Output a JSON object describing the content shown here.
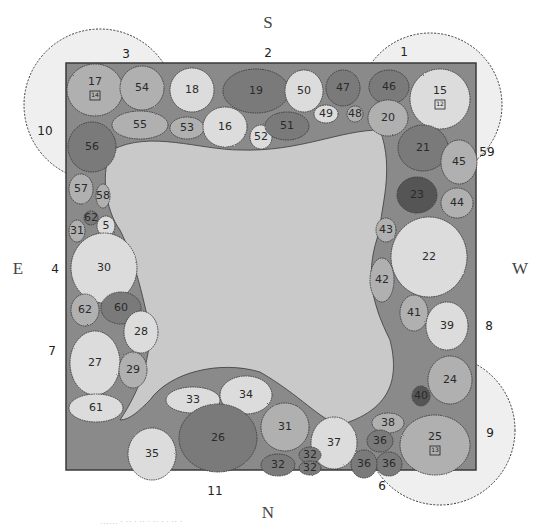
{
  "compass": {
    "north": "N",
    "south": "S",
    "east": "E",
    "west": "W"
  },
  "colors": {
    "border_fill": "#8a8a8a",
    "lawn_fill": "#c9c9c9",
    "tree_canopy": "#ececec",
    "outline": "#3a3a3a",
    "plant_light": "#dcdcdc",
    "plant_mid": "#b0b0b0",
    "plant_dark": "#7a7a7a",
    "plant_darkest": "#555555"
  },
  "bed": {
    "x": 66,
    "y": 63,
    "width": 410,
    "height": 407
  },
  "tree_rings": [
    {
      "label": "3",
      "cx": 100,
      "cy": 105,
      "r": 76,
      "label_x": 126,
      "label_y": 58
    },
    {
      "label": "10",
      "cx": 100,
      "cy": 105,
      "r": 76,
      "label_x": 45,
      "label_y": 135,
      "shared": true
    },
    {
      "label": "1",
      "cx": 430,
      "cy": 105,
      "r": 72,
      "label_x": 404,
      "label_y": 56
    },
    {
      "label": "59",
      "cx": 430,
      "cy": 105,
      "r": 72,
      "label_x": 487,
      "label_y": 156,
      "shared": true
    },
    {
      "label": "9",
      "cx": 440,
      "cy": 430,
      "r": 75,
      "label_x": 490,
      "label_y": 437
    },
    {
      "label": "6",
      "cx": 440,
      "cy": 430,
      "r": 75,
      "label_x": 382,
      "label_y": 490,
      "shared": true
    }
  ],
  "edge_labels": [
    {
      "label": "2",
      "x": 268,
      "y": 57
    },
    {
      "label": "4",
      "x": 55,
      "y": 273
    },
    {
      "label": "7",
      "x": 52,
      "y": 355
    },
    {
      "label": "8",
      "x": 489,
      "y": 330
    },
    {
      "label": "11",
      "x": 215,
      "y": 495
    }
  ],
  "plants": [
    {
      "id": "17",
      "cx": 95,
      "cy": 90,
      "rx": 28,
      "ry": 26,
      "tone": "mid",
      "badge": "14"
    },
    {
      "id": "54",
      "cx": 142,
      "cy": 88,
      "rx": 22,
      "ry": 22,
      "tone": "mid"
    },
    {
      "id": "55",
      "cx": 140,
      "cy": 125,
      "rx": 28,
      "ry": 14,
      "tone": "mid"
    },
    {
      "id": "56",
      "cx": 92,
      "cy": 147,
      "rx": 24,
      "ry": 25,
      "tone": "dark"
    },
    {
      "id": "18",
      "cx": 192,
      "cy": 90,
      "rx": 22,
      "ry": 22,
      "tone": "light"
    },
    {
      "id": "53",
      "cx": 187,
      "cy": 128,
      "rx": 17,
      "ry": 11,
      "tone": "mid"
    },
    {
      "id": "16",
      "cx": 225,
      "cy": 127,
      "rx": 22,
      "ry": 20,
      "tone": "light"
    },
    {
      "id": "52",
      "cx": 261,
      "cy": 137,
      "rx": 11,
      "ry": 12,
      "tone": "light"
    },
    {
      "id": "19",
      "cx": 256,
      "cy": 91,
      "rx": 33,
      "ry": 22,
      "tone": "dark"
    },
    {
      "id": "50",
      "cx": 304,
      "cy": 91,
      "rx": 19,
      "ry": 21,
      "tone": "light"
    },
    {
      "id": "51",
      "cx": 287,
      "cy": 126,
      "rx": 22,
      "ry": 14,
      "tone": "dark"
    },
    {
      "id": "49",
      "cx": 326,
      "cy": 114,
      "rx": 12,
      "ry": 9,
      "tone": "light"
    },
    {
      "id": "47",
      "cx": 343,
      "cy": 88,
      "rx": 17,
      "ry": 18,
      "tone": "dark"
    },
    {
      "id": "48",
      "cx": 355,
      "cy": 114,
      "rx": 8,
      "ry": 8,
      "tone": "mid"
    },
    {
      "id": "46",
      "cx": 389,
      "cy": 87,
      "rx": 20,
      "ry": 17,
      "tone": "dark"
    },
    {
      "id": "15",
      "cx": 440,
      "cy": 99,
      "rx": 30,
      "ry": 30,
      "tone": "light",
      "badge": "12"
    },
    {
      "id": "20",
      "cx": 388,
      "cy": 118,
      "rx": 20,
      "ry": 18,
      "tone": "mid"
    },
    {
      "id": "21",
      "cx": 423,
      "cy": 148,
      "rx": 25,
      "ry": 23,
      "tone": "dark"
    },
    {
      "id": "45",
      "cx": 459,
      "cy": 162,
      "rx": 18,
      "ry": 22,
      "tone": "mid"
    },
    {
      "id": "23",
      "cx": 417,
      "cy": 195,
      "rx": 20,
      "ry": 18,
      "tone": "darkest"
    },
    {
      "id": "44",
      "cx": 457,
      "cy": 203,
      "rx": 16,
      "ry": 15,
      "tone": "mid"
    },
    {
      "id": "43",
      "cx": 386,
      "cy": 230,
      "rx": 10,
      "ry": 12,
      "tone": "mid"
    },
    {
      "id": "22",
      "cx": 429,
      "cy": 257,
      "rx": 38,
      "ry": 40,
      "tone": "light"
    },
    {
      "id": "42",
      "cx": 382,
      "cy": 280,
      "rx": 12,
      "ry": 22,
      "tone": "mid"
    },
    {
      "id": "41",
      "cx": 414,
      "cy": 313,
      "rx": 14,
      "ry": 18,
      "tone": "mid"
    },
    {
      "id": "39",
      "cx": 447,
      "cy": 326,
      "rx": 21,
      "ry": 24,
      "tone": "light"
    },
    {
      "id": "24",
      "cx": 450,
      "cy": 380,
      "rx": 22,
      "ry": 24,
      "tone": "mid"
    },
    {
      "id": "40",
      "cx": 421,
      "cy": 396,
      "rx": 9,
      "ry": 10,
      "tone": "darkest"
    },
    {
      "id": "38",
      "cx": 388,
      "cy": 423,
      "rx": 16,
      "ry": 10,
      "tone": "mid"
    },
    {
      "id": "25",
      "cx": 435,
      "cy": 445,
      "rx": 35,
      "ry": 30,
      "tone": "mid",
      "badge": "13"
    },
    {
      "id": "36",
      "cx": 380,
      "cy": 441,
      "rx": 13,
      "ry": 11,
      "tone": "dark"
    },
    {
      "id": "36",
      "cx": 389,
      "cy": 464,
      "rx": 13,
      "ry": 12,
      "tone": "dark"
    },
    {
      "id": "36",
      "cx": 364,
      "cy": 464,
      "rx": 13,
      "ry": 14,
      "tone": "dark"
    },
    {
      "id": "37",
      "cx": 334,
      "cy": 443,
      "rx": 23,
      "ry": 26,
      "tone": "light"
    },
    {
      "id": "32",
      "cx": 310,
      "cy": 455,
      "rx": 11,
      "ry": 8,
      "tone": "dark"
    },
    {
      "id": "32",
      "cx": 310,
      "cy": 468,
      "rx": 11,
      "ry": 7,
      "tone": "dark"
    },
    {
      "id": "32",
      "cx": 278,
      "cy": 465,
      "rx": 17,
      "ry": 11,
      "tone": "dark"
    },
    {
      "id": "31",
      "cx": 285,
      "cy": 427,
      "rx": 24,
      "ry": 24,
      "tone": "mid"
    },
    {
      "id": "34",
      "cx": 246,
      "cy": 395,
      "rx": 26,
      "ry": 19,
      "tone": "light"
    },
    {
      "id": "33",
      "cx": 193,
      "cy": 400,
      "rx": 27,
      "ry": 13,
      "tone": "light"
    },
    {
      "id": "26",
      "cx": 218,
      "cy": 438,
      "rx": 39,
      "ry": 34,
      "tone": "dark"
    },
    {
      "id": "35",
      "cx": 152,
      "cy": 454,
      "rx": 24,
      "ry": 26,
      "tone": "light"
    },
    {
      "id": "57",
      "cx": 81,
      "cy": 189,
      "rx": 12,
      "ry": 15,
      "tone": "mid"
    },
    {
      "id": "58",
      "cx": 103,
      "cy": 196,
      "rx": 7,
      "ry": 12,
      "tone": "mid"
    },
    {
      "id": "62",
      "cx": 91,
      "cy": 218,
      "rx": 7,
      "ry": 7,
      "tone": "dark"
    },
    {
      "id": "5",
      "cx": 106,
      "cy": 226,
      "rx": 9,
      "ry": 10,
      "tone": "light"
    },
    {
      "id": "31",
      "cx": 77,
      "cy": 231,
      "rx": 8,
      "ry": 11,
      "tone": "mid"
    },
    {
      "id": "30",
      "cx": 104,
      "cy": 268,
      "rx": 33,
      "ry": 35,
      "tone": "light"
    },
    {
      "id": "62",
      "cx": 85,
      "cy": 310,
      "rx": 14,
      "ry": 16,
      "tone": "mid"
    },
    {
      "id": "60",
      "cx": 121,
      "cy": 308,
      "rx": 20,
      "ry": 16,
      "tone": "dark"
    },
    {
      "id": "28",
      "cx": 141,
      "cy": 332,
      "rx": 17,
      "ry": 21,
      "tone": "light"
    },
    {
      "id": "27",
      "cx": 95,
      "cy": 363,
      "rx": 25,
      "ry": 32,
      "tone": "light"
    },
    {
      "id": "29",
      "cx": 133,
      "cy": 370,
      "rx": 14,
      "ry": 18,
      "tone": "mid"
    },
    {
      "id": "61",
      "cx": 96,
      "cy": 408,
      "rx": 27,
      "ry": 14,
      "tone": "light"
    }
  ],
  "caption": "……  ·  ·· ·  ·· ·  ·· · ·  ·· ·"
}
